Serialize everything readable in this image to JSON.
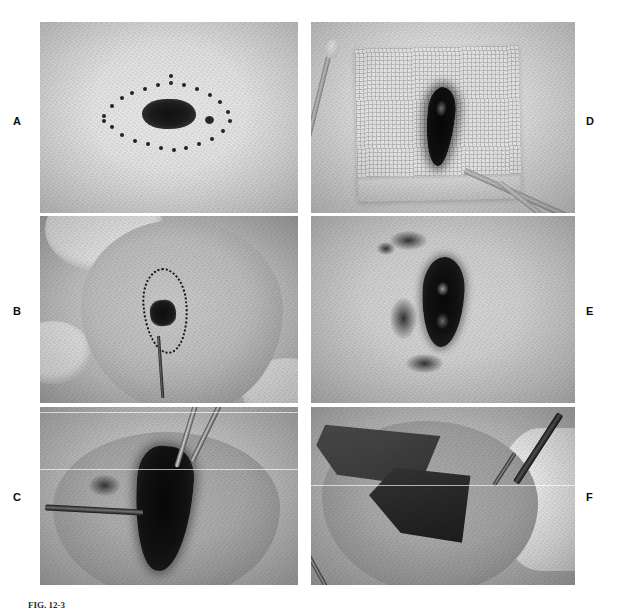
{
  "figure": {
    "caption": "FIG. 12-3",
    "panel_count": 6,
    "colors": {
      "page_background": "#ffffff",
      "label_text": "#0d0d0d",
      "caption_text": "#2b2b2b",
      "photo_placeholder": "#c9c9c9"
    }
  },
  "panels": [
    {
      "id": "panel-a",
      "label": "A",
      "label_side": "left",
      "description": "Pigmented skin lesion outlined with a dotted elliptical excision marking"
    },
    {
      "id": "panel-d",
      "label": "D",
      "label_side": "right",
      "description": "Excised pigmented specimen resting on gauze beside a cotton-tipped applicator"
    },
    {
      "id": "panel-b",
      "label": "B",
      "label_side": "left",
      "description": "Scalpel incising the skin along the dotted elliptical marking"
    },
    {
      "id": "panel-e",
      "label": "E",
      "label_side": "right",
      "description": "Open elliptical wound defect remaining after excision"
    },
    {
      "id": "panel-c",
      "label": "C",
      "label_side": "left",
      "description": "Forceps providing traction on the specimen during deep dissection"
    },
    {
      "id": "panel-f",
      "label": "F",
      "label_side": "right",
      "description": "Undermining of the wound edge with a scissors to mobilize the skin flap"
    }
  ]
}
